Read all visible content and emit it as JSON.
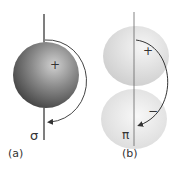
{
  "panels": [
    {
      "id": "a",
      "panel_label": "(a)",
      "symbol": "σ",
      "sign": "+",
      "description": "sigma orbital sphere with rotation arrow about axis"
    },
    {
      "id": "b",
      "panel_label": "(b)",
      "symbol": "π",
      "sign_top": "+",
      "sign_bottom": "−",
      "description": "pi orbital two lobes with rotation arrow about axis"
    }
  ],
  "colors": {
    "sphere_dark": "#3a3a3a",
    "sphere_light": "#d8d8d8",
    "lobe_top": "#e4e4e4",
    "lobe_bottom": "#eaeaea",
    "axis": "#555555",
    "arrow": "#333333"
  }
}
